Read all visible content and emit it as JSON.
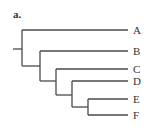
{
  "figure": {
    "label": "a."
  },
  "tree": {
    "type": "cladogram",
    "newick": "(A,(B,(C,(D,(E,F)))));",
    "tips": [
      {
        "id": "A",
        "label": "A"
      },
      {
        "id": "B",
        "label": "B"
      },
      {
        "id": "C",
        "label": "C"
      },
      {
        "id": "D",
        "label": "D"
      },
      {
        "id": "E",
        "label": "E"
      },
      {
        "id": "F",
        "label": "F"
      }
    ],
    "color": "#4a4a4a"
  }
}
